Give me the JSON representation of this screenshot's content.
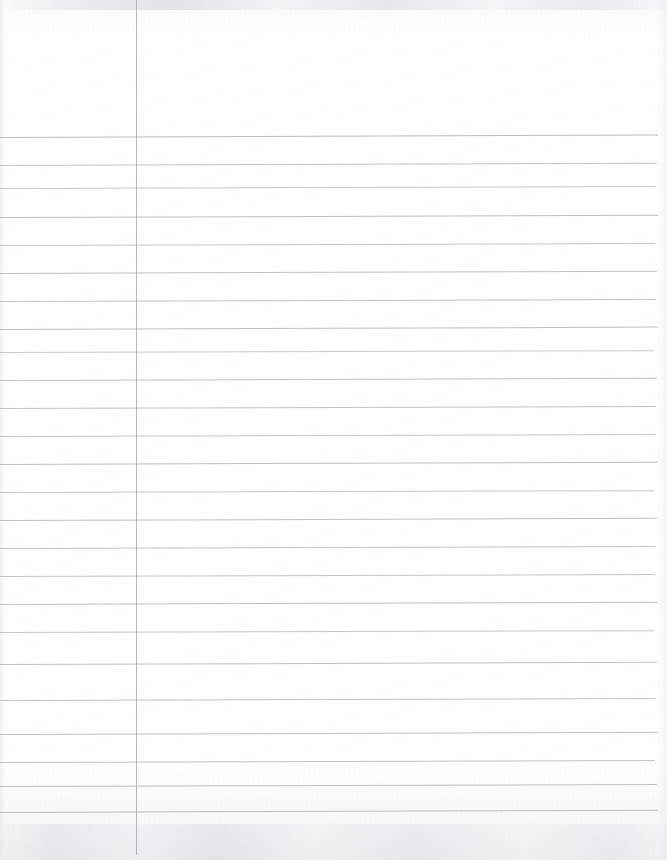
{
  "document": {
    "kind": "scanned-lined-notebook-paper",
    "page_width": 667,
    "page_height": 860,
    "paper_color": "#fdfdfd",
    "is_blank": true,
    "written_text": "",
    "header_note": ""
  },
  "ruling": {
    "line_color": "#a9a9b0",
    "line_thickness": 1,
    "line_count": 24,
    "first_line_y": 137,
    "line_spacing": 28.2,
    "line_start_x": 0,
    "line_end_x": 658,
    "skew_degrees": -0.18,
    "lines": [
      {
        "y": 137,
        "opacity": 0.78,
        "x1": 0,
        "x2": 658,
        "skew": -0.22
      },
      {
        "y": 165,
        "opacity": 0.7,
        "x1": 0,
        "x2": 657,
        "skew": -0.2
      },
      {
        "y": 188,
        "opacity": 0.66,
        "x1": 0,
        "x2": 656,
        "skew": -0.18
      },
      {
        "y": 217,
        "opacity": 0.74,
        "x1": 0,
        "x2": 658,
        "skew": -0.19
      },
      {
        "y": 245,
        "opacity": 0.68,
        "x1": 0,
        "x2": 655,
        "skew": -0.17
      },
      {
        "y": 273,
        "opacity": 0.72,
        "x1": 0,
        "x2": 657,
        "skew": -0.2
      },
      {
        "y": 301,
        "opacity": 0.7,
        "x1": 0,
        "x2": 656,
        "skew": -0.18
      },
      {
        "y": 329,
        "opacity": 0.74,
        "x1": 0,
        "x2": 658,
        "skew": -0.21
      },
      {
        "y": 352,
        "opacity": 0.62,
        "x1": 0,
        "x2": 654,
        "skew": -0.16
      },
      {
        "y": 380,
        "opacity": 0.72,
        "x1": 0,
        "x2": 657,
        "skew": -0.19
      },
      {
        "y": 408,
        "opacity": 0.7,
        "x1": 0,
        "x2": 656,
        "skew": -0.18
      },
      {
        "y": 436,
        "opacity": 0.68,
        "x1": 0,
        "x2": 655,
        "skew": -0.17
      },
      {
        "y": 464,
        "opacity": 0.74,
        "x1": 0,
        "x2": 658,
        "skew": -0.2
      },
      {
        "y": 492,
        "opacity": 0.66,
        "x1": 0,
        "x2": 654,
        "skew": -0.16
      },
      {
        "y": 520,
        "opacity": 0.72,
        "x1": 0,
        "x2": 657,
        "skew": -0.19
      },
      {
        "y": 548,
        "opacity": 0.7,
        "x1": 0,
        "x2": 656,
        "skew": -0.18
      },
      {
        "y": 576,
        "opacity": 0.68,
        "x1": 0,
        "x2": 655,
        "skew": -0.17
      },
      {
        "y": 604,
        "opacity": 0.74,
        "x1": 0,
        "x2": 658,
        "skew": -0.2
      },
      {
        "y": 632,
        "opacity": 0.66,
        "x1": 0,
        "x2": 654,
        "skew": -0.16
      },
      {
        "y": 664,
        "opacity": 0.72,
        "x1": 0,
        "x2": 657,
        "skew": -0.19
      },
      {
        "y": 700,
        "opacity": 0.7,
        "x1": 0,
        "x2": 656,
        "skew": -0.18
      },
      {
        "y": 734,
        "opacity": 0.72,
        "x1": 0,
        "x2": 658,
        "skew": -0.19
      },
      {
        "y": 762,
        "opacity": 0.68,
        "x1": 0,
        "x2": 655,
        "skew": -0.17
      },
      {
        "y": 786,
        "opacity": 0.7,
        "x1": 0,
        "x2": 657,
        "skew": -0.18
      },
      {
        "y": 812,
        "opacity": 0.74,
        "x1": 0,
        "x2": 658,
        "skew": -0.2
      }
    ]
  },
  "margin": {
    "name": "vertical-margin-rule",
    "x": 136,
    "y_start": 0,
    "y_end": 855,
    "color": "#a4a4ac",
    "thickness": 1,
    "opacity": 0.8
  },
  "header_area": {
    "label": "",
    "top": 0,
    "height": 137,
    "is_empty": true
  },
  "footer_area": {
    "label": "",
    "top": 812,
    "height": 48,
    "is_empty": true
  }
}
